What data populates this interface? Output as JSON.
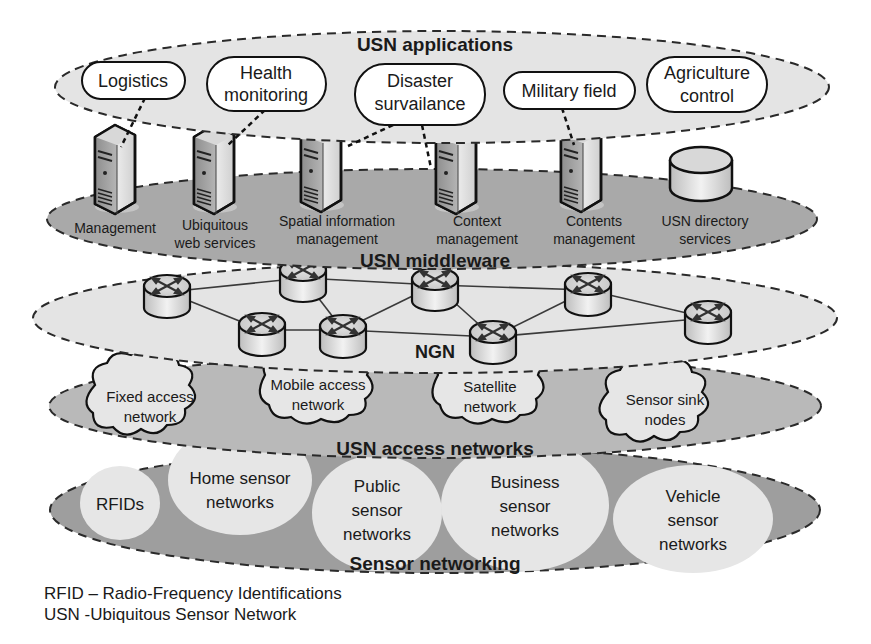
{
  "layers": {
    "applications": {
      "title": "USN applications",
      "items": [
        {
          "line1": "Logistics",
          "line2": ""
        },
        {
          "line1": "Health",
          "line2": "monitoring"
        },
        {
          "line1": "Disaster",
          "line2": "survailance"
        },
        {
          "line1": "Military field",
          "line2": ""
        },
        {
          "line1": "Agriculture",
          "line2": "control"
        }
      ]
    },
    "middleware": {
      "title": "USN middleware",
      "items": [
        {
          "line1": "Management",
          "line2": "",
          "icon": "server-icon"
        },
        {
          "line1": "Ubiquitous",
          "line2": "web services",
          "icon": "server-icon"
        },
        {
          "line1": "Spatial information",
          "line2": "management",
          "icon": "server-icon"
        },
        {
          "line1": "Context",
          "line2": "management",
          "icon": "server-icon"
        },
        {
          "line1": "Contents",
          "line2": "management",
          "icon": "server-icon"
        },
        {
          "line1": "USN directory",
          "line2": "services",
          "icon": "database-icon"
        }
      ]
    },
    "ngn": {
      "title": "NGN",
      "router_count": 9,
      "icon": "router-icon"
    },
    "access": {
      "title": "USN access networks",
      "items": [
        {
          "line1": "Fixed access",
          "line2": "network"
        },
        {
          "line1": "Mobile access",
          "line2": "network"
        },
        {
          "line1": "Satellite",
          "line2": "network"
        },
        {
          "line1": "Sensor sink",
          "line2": "nodes"
        }
      ]
    },
    "sensor": {
      "title": "Sensor networking",
      "items": [
        {
          "line1": "RFIDs",
          "line2": "",
          "line3": ""
        },
        {
          "line1": "Home sensor",
          "line2": "networks",
          "line3": ""
        },
        {
          "line1": "Public",
          "line2": "sensor",
          "line3": "networks"
        },
        {
          "line1": "Business",
          "line2": "sensor",
          "line3": "networks"
        },
        {
          "line1": "Vehicle",
          "line2": "sensor",
          "line3": "networks"
        }
      ]
    }
  },
  "legend": [
    "RFID – Radio-Frequency Identifications",
    "USN -Ubiquitous Sensor Network"
  ],
  "colors": {
    "light_layer": "#e4e4e4",
    "dark_layer": "#a9a9a9",
    "mid_layer": "#b9b9b9",
    "sensor_layer": "#9e9e9e",
    "bubble": "#e6e6e6",
    "outline": "#1a1a1a"
  }
}
